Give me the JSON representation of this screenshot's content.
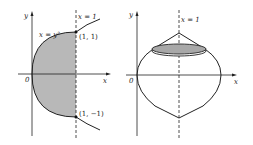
{
  "left_figure": {
    "axis_x_label": "x",
    "axis_y_label": "y",
    "origin_label": "0",
    "curve_label": "x = y²",
    "line_label": "x = 1",
    "point_top_label": "(1, 1)",
    "point_bottom_label": "(1, −1)",
    "region_fill": "#b8b8b8",
    "curve_color": "#222222"
  },
  "right_figure": {
    "axis_x_label": "x",
    "axis_y_label": "y",
    "origin_label": "0",
    "line_label": "x = 1",
    "disk_fill": "#a8a8a8",
    "curve_color": "#222222"
  }
}
